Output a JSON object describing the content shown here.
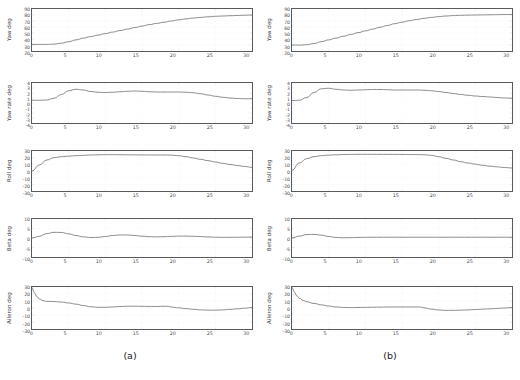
{
  "figure": {
    "captions": [
      {
        "key": "a",
        "label": "(a)"
      },
      {
        "key": "b",
        "label": "(b)"
      }
    ]
  },
  "axis": {
    "x_ticks": [
      "0",
      "5",
      "10",
      "15",
      "20",
      "25",
      "30"
    ],
    "x_min": 0,
    "x_max": 30
  },
  "chart_data": [
    {
      "type": "line",
      "panel": "a1",
      "column": "(a)",
      "title": "",
      "xlabel": "",
      "ylabel": "Yaw deg",
      "ylim": [
        20,
        90
      ],
      "xlim": [
        0,
        30
      ],
      "yticks": [
        "90",
        "80",
        "70",
        "60",
        "50",
        "40",
        "30",
        "20"
      ],
      "grid": true,
      "x": [
        0,
        1,
        2,
        3,
        4,
        5,
        6,
        7,
        8,
        9,
        10,
        11,
        12,
        13,
        14,
        15,
        16,
        17,
        18,
        19,
        20,
        21,
        22,
        23,
        24,
        25,
        26,
        27,
        28,
        29,
        30
      ],
      "values": [
        31,
        31,
        31,
        31.5,
        33,
        35.5,
        38.5,
        41.5,
        44,
        46.5,
        49,
        51.5,
        54,
        56.5,
        59,
        61.5,
        64,
        66,
        68,
        70,
        72,
        73.5,
        75,
        76,
        77,
        77.8,
        78.3,
        78.8,
        79.2,
        79.6,
        80
      ]
    },
    {
      "type": "line",
      "panel": "a2",
      "column": "(a)",
      "ylabel": "Yaw rate deg",
      "ylim": [
        -4,
        4
      ],
      "xlim": [
        0,
        30
      ],
      "yticks": [
        "4",
        "3",
        "2",
        "1",
        "0",
        "-1",
        "-2",
        "-3",
        "-4"
      ],
      "grid": true,
      "x": [
        0,
        1,
        2,
        3,
        4,
        5,
        6,
        7,
        8,
        9,
        10,
        11,
        12,
        13,
        14,
        15,
        16,
        17,
        18,
        19,
        20,
        21,
        22,
        23,
        24,
        25,
        26,
        27,
        28,
        29,
        30
      ],
      "values": [
        0.55,
        0.55,
        0.6,
        0.95,
        1.7,
        2.45,
        2.75,
        2.6,
        2.3,
        2.15,
        2.1,
        2.15,
        2.25,
        2.35,
        2.4,
        2.35,
        2.25,
        2.2,
        2.2,
        2.2,
        2.2,
        2.15,
        2.05,
        1.85,
        1.6,
        1.35,
        1.15,
        1.0,
        0.9,
        0.85,
        0.85
      ]
    },
    {
      "type": "line",
      "panel": "a3",
      "column": "(a)",
      "ylabel": "Roll deg",
      "ylim": [
        -30,
        30
      ],
      "xlim": [
        0,
        30
      ],
      "yticks": [
        "30",
        "20",
        "10",
        "0",
        "-10",
        "-20",
        "-30"
      ],
      "grid": true,
      "x": [
        0,
        1,
        2,
        3,
        4,
        5,
        6,
        7,
        8,
        9,
        10,
        11,
        12,
        13,
        14,
        15,
        16,
        17,
        18,
        19,
        20,
        21,
        22,
        23,
        24,
        25,
        26,
        27,
        28,
        29,
        30
      ],
      "values": [
        0,
        9,
        16.5,
        20,
        21.5,
        22.3,
        23,
        23.5,
        24,
        24.3,
        24.5,
        24.5,
        24.4,
        24.3,
        24.2,
        24.1,
        24.0,
        24.0,
        24.0,
        23.8,
        23.0,
        21.5,
        19.5,
        17.5,
        15.5,
        13.5,
        11.5,
        9.8,
        8.2,
        6.8,
        5.5
      ]
    },
    {
      "type": "line",
      "panel": "a4",
      "column": "(a)",
      "ylabel": "Beta deg",
      "ylim": [
        -10,
        10
      ],
      "xlim": [
        0,
        30
      ],
      "yticks": [
        "10",
        "5",
        "0",
        "-5",
        "-10"
      ],
      "grid": true,
      "x": [
        0,
        1,
        2,
        3,
        4,
        5,
        6,
        7,
        8,
        9,
        10,
        11,
        12,
        13,
        14,
        15,
        16,
        17,
        18,
        19,
        20,
        21,
        22,
        23,
        24,
        25,
        26,
        27,
        28,
        29,
        30
      ],
      "values": [
        0.0,
        0.9,
        2.3,
        3.0,
        2.9,
        2.2,
        1.3,
        0.6,
        0.25,
        0.35,
        0.8,
        1.3,
        1.6,
        1.6,
        1.3,
        0.95,
        0.7,
        0.6,
        0.7,
        0.85,
        1.0,
        1.0,
        0.9,
        0.75,
        0.55,
        0.4,
        0.35,
        0.35,
        0.4,
        0.45,
        0.45
      ]
    },
    {
      "type": "line",
      "panel": "a5",
      "column": "(a)",
      "ylabel": "Aileron deg",
      "ylim": [
        -30,
        30
      ],
      "xlim": [
        0,
        30
      ],
      "yticks": [
        "30",
        "20",
        "10",
        "0",
        "-10",
        "-20",
        "-30"
      ],
      "grid": true,
      "x": [
        0,
        0.3,
        0.7,
        1,
        1.5,
        2,
        3,
        4,
        5,
        6,
        7,
        8,
        9,
        10,
        11,
        12,
        13,
        14,
        15,
        16,
        17,
        18,
        18.6,
        19,
        20,
        21,
        22,
        23,
        24,
        25,
        26,
        27,
        28,
        29,
        30
      ],
      "values": [
        30,
        22,
        16,
        13,
        10.5,
        9.5,
        9.2,
        8.5,
        7.2,
        5.5,
        3.5,
        1.8,
        1.0,
        1.0,
        1.5,
        2.1,
        2.5,
        2.6,
        2.4,
        2.2,
        2.2,
        2.4,
        2.5,
        1.3,
        0.2,
        -0.9,
        -1.9,
        -2.7,
        -3.1,
        -3.1,
        -2.7,
        -2.0,
        -1.2,
        -0.3,
        0.6
      ]
    },
    {
      "type": "line",
      "panel": "b1",
      "column": "(b)",
      "ylabel": "Yaw deg",
      "ylim": [
        20,
        90
      ],
      "xlim": [
        0,
        30
      ],
      "yticks": [
        "90",
        "80",
        "70",
        "60",
        "50",
        "40",
        "30",
        "20"
      ],
      "grid": true,
      "x": [
        0,
        1,
        2,
        3,
        4,
        5,
        6,
        7,
        8,
        9,
        10,
        11,
        12,
        13,
        14,
        15,
        16,
        17,
        18,
        19,
        20,
        21,
        22,
        23,
        24,
        25,
        26,
        27,
        28,
        29,
        30
      ],
      "values": [
        30,
        29.8,
        30.5,
        32.5,
        35.5,
        38.5,
        41.5,
        44.5,
        47.5,
        50.5,
        53.5,
        56.5,
        59.5,
        62.5,
        65.5,
        68,
        70.5,
        72.5,
        74.5,
        76,
        77.3,
        78.3,
        79,
        79.5,
        79.8,
        80,
        80.2,
        80.4,
        80.6,
        80.8,
        81
      ]
    },
    {
      "type": "line",
      "panel": "b2",
      "column": "(b)",
      "ylabel": "Yaw rate deg",
      "ylim": [
        -4,
        4
      ],
      "xlim": [
        0,
        30
      ],
      "yticks": [
        "4",
        "3",
        "2",
        "1",
        "0",
        "-1",
        "-2",
        "-3",
        "-4"
      ],
      "grid": true,
      "x": [
        0,
        1,
        2,
        3,
        4,
        5,
        6,
        7,
        8,
        9,
        10,
        11,
        12,
        13,
        14,
        15,
        16,
        17,
        18,
        19,
        20,
        21,
        22,
        23,
        24,
        25,
        26,
        27,
        28,
        29,
        30
      ],
      "values": [
        0.5,
        0.55,
        1.1,
        2.1,
        2.85,
        2.95,
        2.75,
        2.6,
        2.55,
        2.6,
        2.65,
        2.7,
        2.7,
        2.65,
        2.6,
        2.6,
        2.6,
        2.6,
        2.55,
        2.45,
        2.3,
        2.1,
        1.9,
        1.7,
        1.55,
        1.4,
        1.3,
        1.2,
        1.1,
        1.0,
        0.95
      ]
    },
    {
      "type": "line",
      "panel": "b3",
      "column": "(b)",
      "ylabel": "Roll deg",
      "ylim": [
        -30,
        30
      ],
      "xlim": [
        0,
        30
      ],
      "yticks": [
        "30",
        "20",
        "10",
        "0",
        "-10",
        "-20",
        "-30"
      ],
      "grid": true,
      "x": [
        0,
        1,
        2,
        3,
        4,
        5,
        6,
        7,
        8,
        9,
        10,
        11,
        12,
        13,
        14,
        15,
        16,
        17,
        18,
        19,
        20,
        21,
        22,
        23,
        24,
        25,
        26,
        27,
        28,
        29,
        30
      ],
      "values": [
        1,
        12,
        18.5,
        21.5,
        23,
        23.8,
        24.3,
        24.7,
        24.9,
        25.0,
        25.0,
        25.0,
        25.0,
        24.9,
        24.9,
        24.8,
        24.7,
        24.6,
        24.4,
        23.5,
        21.5,
        19,
        16.5,
        14,
        12,
        10.2,
        8.6,
        7.2,
        6.2,
        5.2,
        4.5
      ]
    },
    {
      "type": "line",
      "panel": "b4",
      "column": "(b)",
      "ylabel": "Beta deg",
      "ylim": [
        -10,
        10
      ],
      "xlim": [
        0,
        30
      ],
      "yticks": [
        "10",
        "5",
        "0",
        "-5",
        "-10"
      ],
      "grid": true,
      "x": [
        0,
        1,
        2,
        3,
        4,
        5,
        6,
        7,
        8,
        9,
        10,
        11,
        12,
        13,
        14,
        15,
        16,
        17,
        18,
        19,
        20,
        21,
        22,
        23,
        24,
        25,
        26,
        27,
        28,
        29,
        30
      ],
      "values": [
        0.0,
        1.0,
        1.8,
        1.9,
        1.5,
        0.8,
        0.3,
        0.15,
        0.2,
        0.3,
        0.35,
        0.4,
        0.4,
        0.4,
        0.4,
        0.4,
        0.4,
        0.4,
        0.4,
        0.4,
        0.4,
        0.4,
        0.4,
        0.4,
        0.4,
        0.4,
        0.4,
        0.4,
        0.4,
        0.4,
        0.4
      ]
    },
    {
      "type": "line",
      "panel": "b5",
      "column": "(b)",
      "ylabel": "Aileron deg",
      "ylim": [
        -30,
        30
      ],
      "xlim": [
        0,
        30
      ],
      "yticks": [
        "30",
        "20",
        "10",
        "0",
        "-10",
        "-20",
        "-30"
      ],
      "grid": true,
      "x": [
        0,
        0.3,
        0.7,
        1,
        1.5,
        2,
        3,
        4,
        5,
        6,
        7,
        8,
        9,
        10,
        11,
        12,
        13,
        14,
        15,
        16,
        17,
        17.5,
        18,
        19,
        20,
        21,
        22,
        23,
        24,
        25,
        26,
        27,
        28,
        29,
        30
      ],
      "values": [
        30,
        23,
        17,
        14,
        11,
        9,
        6.5,
        4.5,
        2.8,
        1.5,
        0.8,
        0.6,
        0.7,
        0.9,
        1.1,
        1.3,
        1.4,
        1.5,
        1.5,
        1.5,
        1.5,
        1.4,
        0.3,
        -1.6,
        -2.8,
        -3.4,
        -3.4,
        -3.1,
        -2.7,
        -2.2,
        -1.7,
        -1.2,
        -0.6,
        0.0,
        0.6
      ]
    }
  ]
}
